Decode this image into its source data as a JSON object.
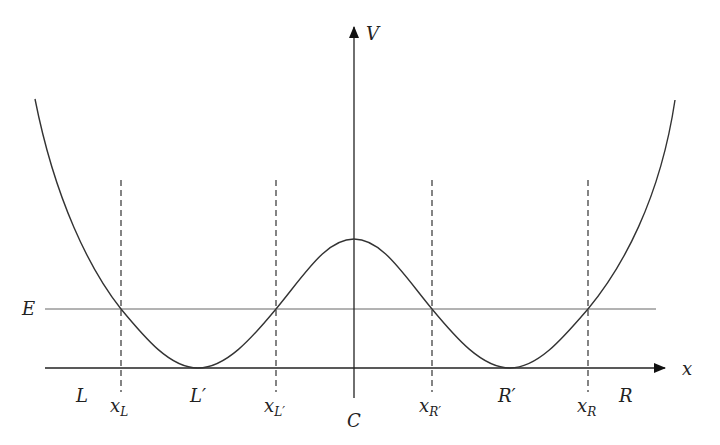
{
  "diagram": {
    "axes": {
      "x_label": "x",
      "y_label": "V"
    },
    "energy_label": "E",
    "region_labels": {
      "left": "L",
      "left_well": "L′",
      "center": "C",
      "right_well": "R′",
      "right": "R"
    },
    "turning_points": [
      {
        "base": "x",
        "sub": "L"
      },
      {
        "base": "x",
        "sub": "L′"
      },
      {
        "base": "x",
        "sub": "R′"
      },
      {
        "base": "x",
        "sub": "R"
      }
    ],
    "colors": {
      "curve": "#333333",
      "axis": "#222222",
      "energy_line": "#666666",
      "dashed": "#333333"
    }
  }
}
